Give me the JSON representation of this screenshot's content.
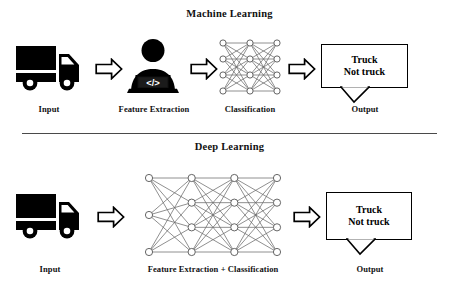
{
  "figure": {
    "background": "#ffffff",
    "ink": "#000000",
    "divider_color": "#4a4a4a"
  },
  "sections": [
    {
      "id": "machine-learning",
      "title": "Machine Learning",
      "stages": [
        {
          "key": "input",
          "label": "Input",
          "icon": "truck-icon"
        },
        {
          "key": "feature-extraction",
          "label": "Feature Extraction",
          "icon": "person-laptop-code-icon"
        },
        {
          "key": "classification",
          "label": "Classification",
          "icon": "neural-network-icon"
        },
        {
          "key": "output",
          "label": "Output",
          "icon": "speech-box-icon"
        }
      ],
      "output_box": {
        "line1": "Truck",
        "line2": "Not truck"
      },
      "network": {
        "layers": [
          4,
          4,
          4
        ],
        "node_fill": "#ffffff",
        "node_stroke": "#555555",
        "edge_color": "#6b6b6b"
      },
      "arrows": [
        "arrow-right-icon",
        "arrow-right-icon",
        "arrow-right-icon"
      ]
    },
    {
      "id": "deep-learning",
      "title": "Deep Learning",
      "stages": [
        {
          "key": "input",
          "label": "Input",
          "icon": "truck-icon"
        },
        {
          "key": "feature-extraction-classification",
          "label": "Feature Extraction + Classification",
          "icon": "deep-neural-network-icon"
        },
        {
          "key": "output",
          "label": "Output",
          "icon": "speech-box-icon"
        }
      ],
      "output_box": {
        "line1": "Truck",
        "line2": "Not truck"
      },
      "network": {
        "layers": [
          3,
          4,
          4,
          4
        ],
        "node_fill": "#ffffff",
        "node_stroke": "#555555",
        "edge_color": "#6b6b6b"
      },
      "arrows": [
        "arrow-right-icon",
        "arrow-right-icon"
      ]
    }
  ]
}
